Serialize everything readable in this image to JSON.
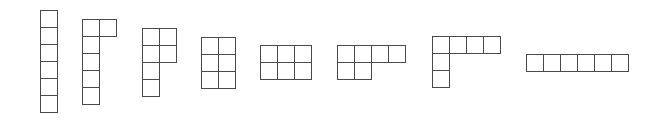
{
  "diagram": {
    "line_color": "#4a4a4a",
    "cell_size": 18,
    "shapes": [
      {
        "name": "shape-1-column",
        "x": 40,
        "y": 10,
        "cells": [
          [
            0,
            0
          ],
          [
            0,
            1
          ],
          [
            0,
            2
          ],
          [
            0,
            3
          ],
          [
            0,
            4
          ],
          [
            0,
            5
          ]
        ]
      },
      {
        "name": "shape-2",
        "x": 82,
        "y": 19,
        "cells": [
          [
            0,
            0
          ],
          [
            1,
            0
          ],
          [
            0,
            1
          ],
          [
            0,
            2
          ],
          [
            0,
            3
          ],
          [
            0,
            4
          ]
        ]
      },
      {
        "name": "shape-3",
        "x": 142,
        "y": 28,
        "cells": [
          [
            0,
            0
          ],
          [
            1,
            0
          ],
          [
            0,
            1
          ],
          [
            1,
            1
          ],
          [
            0,
            2
          ],
          [
            0,
            3
          ]
        ]
      },
      {
        "name": "shape-4",
        "x": 201,
        "y": 37,
        "cells": [
          [
            0,
            0
          ],
          [
            1,
            0
          ],
          [
            0,
            1
          ],
          [
            1,
            1
          ],
          [
            0,
            2
          ],
          [
            1,
            2
          ]
        ]
      },
      {
        "name": "shape-5",
        "x": 260,
        "y": 45,
        "cells": [
          [
            0,
            0
          ],
          [
            1,
            0
          ],
          [
            2,
            0
          ],
          [
            0,
            1
          ],
          [
            1,
            1
          ],
          [
            2,
            1
          ]
        ]
      },
      {
        "name": "shape-6",
        "x": 337,
        "y": 45,
        "cells": [
          [
            0,
            0
          ],
          [
            1,
            0
          ],
          [
            2,
            0
          ],
          [
            3,
            0
          ],
          [
            0,
            1
          ],
          [
            1,
            1
          ]
        ]
      },
      {
        "name": "shape-7",
        "x": 432,
        "y": 36,
        "cells": [
          [
            0,
            0
          ],
          [
            1,
            0
          ],
          [
            2,
            0
          ],
          [
            3,
            0
          ],
          [
            0,
            1
          ],
          [
            0,
            2
          ]
        ]
      },
      {
        "name": "shape-8-row",
        "x": 526,
        "y": 54,
        "cells": [
          [
            0,
            0
          ],
          [
            1,
            0
          ],
          [
            2,
            0
          ],
          [
            3,
            0
          ],
          [
            4,
            0
          ],
          [
            5,
            0
          ]
        ]
      }
    ]
  }
}
